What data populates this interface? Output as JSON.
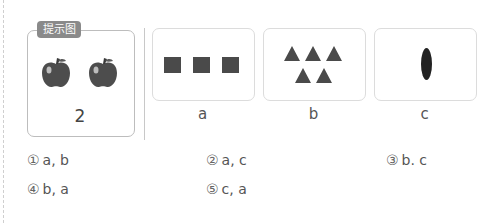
{
  "hint": {
    "tag_label": "提示图",
    "apple_count_label": "2",
    "icons": [
      "apple-icon",
      "apple-icon"
    ]
  },
  "cards": [
    {
      "label": "a",
      "content": "3 squares"
    },
    {
      "label": "b",
      "content": "5 triangles"
    },
    {
      "label": "c",
      "content": "1 oval"
    }
  ],
  "options": [
    {
      "num": "①",
      "text": "a, b"
    },
    {
      "num": "②",
      "text": "a, c"
    },
    {
      "num": "③",
      "text": "b. c"
    },
    {
      "num": "④",
      "text": "b, a"
    },
    {
      "num": "⑤",
      "text": "c, a"
    }
  ],
  "colors": {
    "shape_fill": "#4a4a4a",
    "tag_bg": "#8a8a8a",
    "border": "#bdbdbd"
  }
}
